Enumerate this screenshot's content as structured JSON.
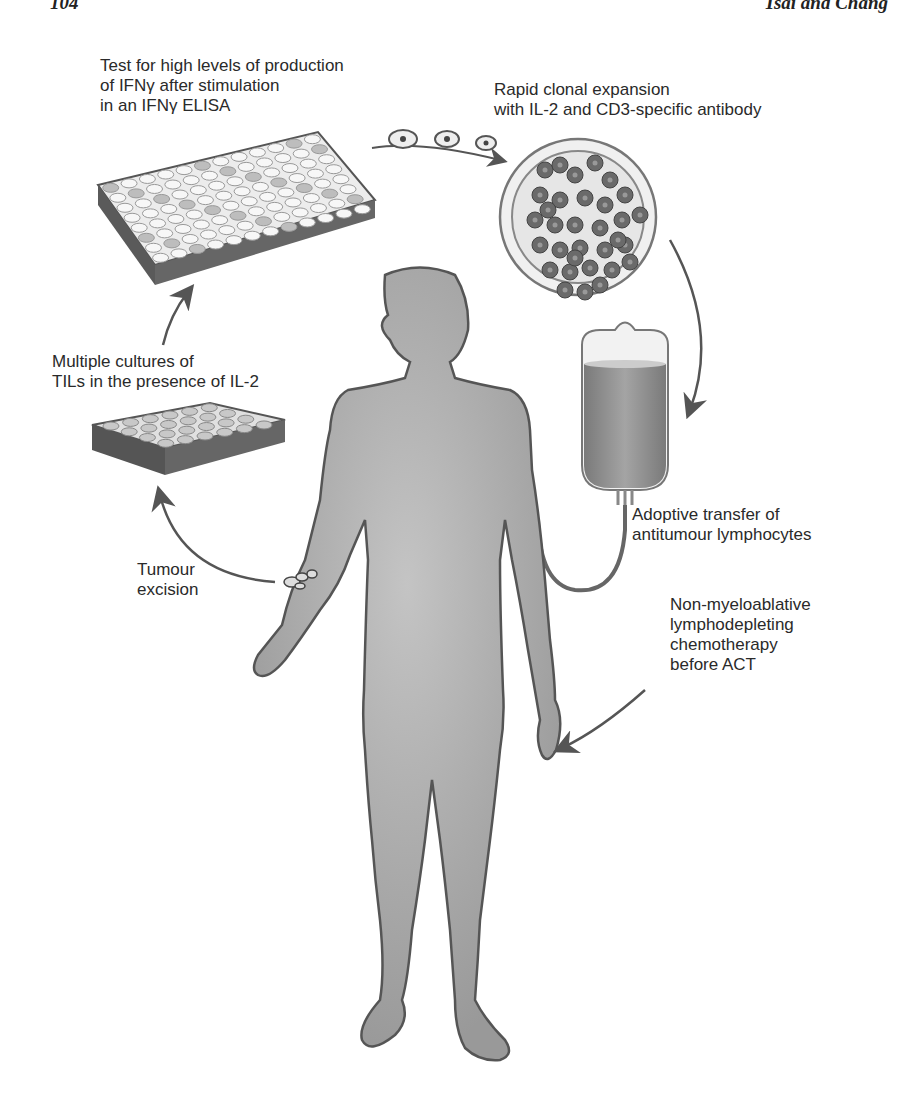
{
  "page_header": {
    "page_number": "104",
    "running_head": "Tsai and Chang"
  },
  "figure": {
    "labels": {
      "elisa_test": "Test for high levels of production\nof IFNγ after stimulation\nin an IFNγ ELISA",
      "clonal_expansion": "Rapid clonal expansion\nwith IL-2 and CD3-specific antibody",
      "multiple_cultures": "Multiple cultures of\nTILs in the presence of IL-2",
      "tumour_excision": "Tumour\nexcision",
      "adoptive_transfer": "Adoptive transfer of\nantitumour lymphocytes",
      "lymphodepletion": "Non-myeloablative\nlymphodepleting\nchemotherapy\nbefore ACT"
    },
    "steps": [
      "Tumour excision",
      "Multiple cultures of TILs in the presence of IL-2",
      "Test for high levels of production of IFNγ after stimulation in an IFNγ ELISA",
      "Rapid clonal expansion with IL-2 and CD3-specific antibody",
      "Adoptive transfer of antitumour lymphocytes",
      "Non-myeloablative lymphodepleting chemotherapy before ACT"
    ],
    "colors": {
      "body_fill": "#a9a9a9",
      "outline": "#555555",
      "plate_side": "#555555",
      "well_light": "#f2f2f2",
      "well_dark": "#b8b8b8",
      "cell": "#6a6a6a",
      "bag_fluid": "#8c8c8c",
      "arrow": "#555555"
    }
  }
}
